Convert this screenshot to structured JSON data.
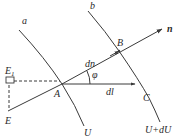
{
  "diagram": {
    "colors": {
      "line": "#3a3a3a",
      "text": "#2a2a2a",
      "background": "#ffffff"
    },
    "labels": {
      "curve_a": "a",
      "curve_b": "b",
      "point_A": "A",
      "point_B": "B",
      "point_C": "C",
      "point_E": "E",
      "point_E1": "E",
      "point_E1_sub": "1",
      "normal": "n",
      "dn": "dn",
      "dl": "dl",
      "angle": "φ",
      "surface_U": "U",
      "surface_U_dU": "U+dU"
    },
    "points": {
      "A": [
        62,
        84
      ],
      "B": [
        119,
        51
      ],
      "C_label": [
        143,
        100
      ],
      "E": [
        8,
        111
      ],
      "E1": [
        8,
        81
      ],
      "n_tip": [
        162,
        29
      ],
      "dl_tip": [
        135,
        84
      ]
    }
  }
}
